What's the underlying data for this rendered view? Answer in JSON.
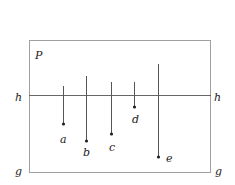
{
  "diagram": {
    "frame_label": "P",
    "horizontal_line": {
      "label_left": "h",
      "label_right": "h"
    },
    "bottom_line": {
      "label_left": "g",
      "label_right": "g"
    },
    "stems": [
      {
        "label": "a",
        "x": 63,
        "top": 86,
        "end": 124,
        "lx": 60,
        "ly": 143
      },
      {
        "label": "b",
        "x": 86,
        "top": 76,
        "end": 141,
        "lx": 83,
        "ly": 156
      },
      {
        "label": "c",
        "x": 111,
        "top": 82,
        "end": 134,
        "lx": 109,
        "ly": 151
      },
      {
        "label": "d",
        "x": 134,
        "top": 82,
        "end": 107,
        "lx": 132,
        "ly": 123
      },
      {
        "label": "e",
        "x": 158,
        "top": 64,
        "end": 157,
        "lx": 166,
        "ly": 162
      }
    ],
    "colors": {
      "frame": "#999999",
      "line": "#555555",
      "text": "#222222"
    }
  }
}
